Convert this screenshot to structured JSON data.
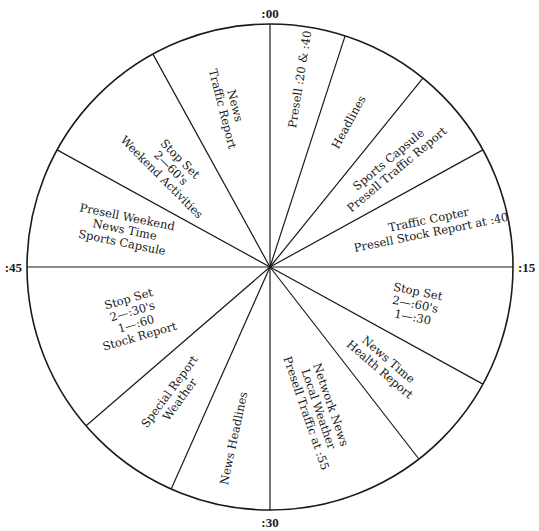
{
  "tick_labels": [
    {
      "id": "top",
      "text": ":00"
    },
    {
      "id": "right",
      "text": ":15"
    },
    {
      "id": "bottom",
      "text": ":30"
    },
    {
      "id": "left",
      "text": ":45"
    }
  ],
  "segments": [
    {
      "start_minute": 0.0,
      "end_minute": 3.0,
      "lines": [
        "Presell :20 & :40"
      ]
    },
    {
      "start_minute": 3.0,
      "end_minute": 6.5,
      "lines": [
        "Headlines"
      ]
    },
    {
      "start_minute": 6.5,
      "end_minute": 10.2,
      "lines": [
        "Sports Capsule",
        "Presell Traffic Report"
      ]
    },
    {
      "start_minute": 10.2,
      "end_minute": 15.0,
      "lines": [
        "Traffic Copter",
        "Presell Stock Report at :40"
      ]
    },
    {
      "start_minute": 15.0,
      "end_minute": 19.8,
      "lines": [
        "Stop Set",
        "2—:60's",
        "1—:30"
      ]
    },
    {
      "start_minute": 19.8,
      "end_minute": 23.7,
      "lines": [
        "News Time",
        "Health Report"
      ]
    },
    {
      "start_minute": 23.7,
      "end_minute": 30.0,
      "lines": [
        "Network News",
        "Local Weather",
        "Presell Traffic at :55"
      ]
    },
    {
      "start_minute": 30.0,
      "end_minute": 34.0,
      "lines": [
        "News Headlines"
      ]
    },
    {
      "start_minute": 34.0,
      "end_minute": 38.2,
      "lines": [
        "Special Report",
        "Weather"
      ]
    },
    {
      "start_minute": 38.2,
      "end_minute": 45.0,
      "lines": [
        "Stop Set",
        "2—:30's",
        "1—:60",
        "Stock Report"
      ]
    },
    {
      "start_minute": 45.0,
      "end_minute": 49.8,
      "lines": [
        "Presell Weekend",
        "News Time",
        "Sports Capsule"
      ]
    },
    {
      "start_minute": 49.8,
      "end_minute": 55.2,
      "lines": [
        "Stop Set",
        "2—60's",
        "Weekend Activities"
      ]
    },
    {
      "start_minute": 55.2,
      "end_minute": 60.0,
      "lines": [
        "News",
        "Traffic Report"
      ]
    }
  ],
  "colors": {
    "ink": "#1a1a1a",
    "background": "#ffffff"
  }
}
